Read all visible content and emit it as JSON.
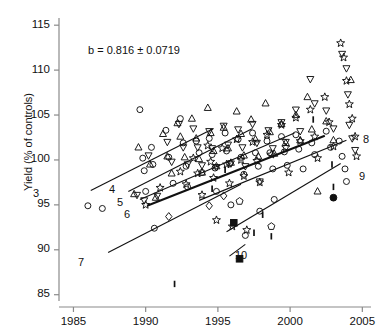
{
  "figure": {
    "width": 384,
    "height": 336,
    "background": "#ffffff",
    "ink": "#111111"
  },
  "annotation": {
    "equation": "b = 0.816 ± 0.0719",
    "equation_x": 88,
    "equation_y": 44
  },
  "axes": {
    "ylabel": "Yield (% of controls)",
    "xlabel": "",
    "x_ticks": [
      "1985",
      "1990",
      "1995",
      "2000",
      "2005"
    ],
    "y_ticks": [
      "85",
      "90",
      "95",
      "100",
      "105",
      "110",
      "115"
    ],
    "xlim": [
      1984.0,
      2005.6
    ],
    "ylim": [
      84.3,
      115.8
    ],
    "plot_rect": {
      "left": 59,
      "top": 18,
      "right": 371,
      "bottom": 301
    },
    "x_axis_baseline_y": 307,
    "spine_color": "#8a8a8a",
    "tick_len": 5
  },
  "chart_data": {
    "type": "scatter",
    "title": "",
    "xlabel": "",
    "ylabel": "Yield (% of controls)",
    "xlim": [
      1984.0,
      2005.6
    ],
    "ylim": [
      84.3,
      115.8
    ],
    "grid": false,
    "legend": "none",
    "annotations": [
      {
        "text": "b = 0.816 ± 0.0719",
        "x": 1990.0,
        "y": 112.0
      }
    ],
    "series": [
      {
        "name": "open-circle",
        "marker": "circle-open",
        "points": [
          [
            1986.0,
            94.9
          ],
          [
            1987.0,
            94.6
          ],
          [
            1989.6,
            105.6
          ],
          [
            1989.8,
            100.2
          ],
          [
            1989.9,
            98.8
          ],
          [
            1990.0,
            96.5
          ],
          [
            1990.4,
            101.4
          ],
          [
            1990.5,
            99.5
          ],
          [
            1990.6,
            92.4
          ],
          [
            1991.4,
            103.3
          ],
          [
            1991.6,
            100.3
          ],
          [
            1991.9,
            97.4
          ],
          [
            1992.4,
            104.6
          ],
          [
            1992.6,
            101.9
          ],
          [
            1992.8,
            99.3
          ],
          [
            1992.9,
            97.0
          ],
          [
            1993.5,
            102.1
          ],
          [
            1993.7,
            100.8
          ],
          [
            1993.9,
            98.6
          ],
          [
            1994.4,
            102.4
          ],
          [
            1994.6,
            100.6
          ],
          [
            1994.8,
            99.1
          ],
          [
            1994.9,
            96.5
          ],
          [
            1995.5,
            103.0
          ],
          [
            1995.6,
            101.0
          ],
          [
            1995.8,
            99.6
          ],
          [
            1995.9,
            95.0
          ],
          [
            1996.4,
            102.3
          ],
          [
            1996.6,
            100.3
          ],
          [
            1996.8,
            98.4
          ],
          [
            1996.9,
            91.6
          ],
          [
            1997.4,
            103.0
          ],
          [
            1997.6,
            100.8
          ],
          [
            1997.8,
            99.3
          ],
          [
            1997.9,
            94.3
          ],
          [
            1998.4,
            102.1
          ],
          [
            1998.6,
            100.8
          ],
          [
            1998.8,
            99.0
          ],
          [
            1998.9,
            95.6
          ],
          [
            1999.4,
            102.6
          ],
          [
            1999.6,
            100.9
          ],
          [
            1999.8,
            99.4
          ],
          [
            2000.4,
            102.8
          ],
          [
            2000.6,
            101.2
          ],
          [
            2000.9,
            99.0
          ],
          [
            2001.5,
            101.9
          ],
          [
            2001.7,
            100.6
          ],
          [
            2002.5,
            103.2
          ],
          [
            2002.8,
            101.4
          ],
          [
            2003.4,
            102.1
          ],
          [
            2003.6,
            100.4
          ],
          [
            2003.8,
            99.0
          ],
          [
            2003.9,
            97.6
          ]
        ]
      },
      {
        "name": "open-up-triangle",
        "marker": "triangle-up-open",
        "points": [
          [
            1989.2,
            96.2
          ],
          [
            1989.5,
            101.4
          ],
          [
            1990.3,
            99.5
          ],
          [
            1990.7,
            95.8
          ],
          [
            1991.2,
            102.9
          ],
          [
            1991.5,
            100.4
          ],
          [
            1991.8,
            98.5
          ],
          [
            1992.2,
            104.1
          ],
          [
            1992.4,
            102.6
          ],
          [
            1992.7,
            100.3
          ],
          [
            1993.2,
            104.6
          ],
          [
            1993.5,
            102.4
          ],
          [
            1993.7,
            100.1
          ],
          [
            1993.9,
            98.6
          ],
          [
            1994.3,
            105.8
          ],
          [
            1994.5,
            103.0
          ],
          [
            1994.7,
            101.0
          ],
          [
            1994.9,
            99.3
          ],
          [
            1995.4,
            103.6
          ],
          [
            1995.7,
            101.3
          ],
          [
            1995.9,
            99.7
          ],
          [
            1996.3,
            105.4
          ],
          [
            1996.6,
            102.9
          ],
          [
            1996.8,
            100.5
          ],
          [
            1997.3,
            104.5
          ],
          [
            1997.6,
            102.3
          ],
          [
            1997.8,
            100.4
          ],
          [
            1998.3,
            106.3
          ],
          [
            1998.6,
            103.1
          ],
          [
            1998.9,
            100.7
          ],
          [
            1999.4,
            104.0
          ],
          [
            1999.7,
            101.9
          ],
          [
            2000.4,
            105.0
          ],
          [
            2000.7,
            102.2
          ],
          [
            2001.2,
            107.0
          ],
          [
            2001.5,
            103.4
          ],
          [
            2001.9,
            96.5
          ],
          [
            2002.5,
            104.3
          ],
          [
            2003.0,
            102.2
          ],
          [
            2004.2,
            108.9
          ]
        ]
      },
      {
        "name": "open-down-triangle",
        "marker": "triangle-down-open",
        "points": [
          [
            1989.4,
            96.1
          ],
          [
            1989.9,
            95.5
          ],
          [
            1990.2,
            100.5
          ],
          [
            1990.8,
            96.0
          ],
          [
            1991.5,
            102.0
          ],
          [
            1991.8,
            99.8
          ],
          [
            1992.3,
            104.0
          ],
          [
            1992.6,
            101.4
          ],
          [
            1992.9,
            99.5
          ],
          [
            1993.3,
            103.5
          ],
          [
            1993.6,
            101.4
          ],
          [
            1993.9,
            99.4
          ],
          [
            1994.4,
            103.2
          ],
          [
            1994.6,
            101.3
          ],
          [
            1994.9,
            99.2
          ],
          [
            1995.4,
            103.8
          ],
          [
            1995.7,
            101.7
          ],
          [
            1995.9,
            99.6
          ],
          [
            1996.4,
            103.4
          ],
          [
            1996.7,
            101.4
          ],
          [
            1996.9,
            99.3
          ],
          [
            1997.4,
            104.0
          ],
          [
            1997.7,
            101.9
          ],
          [
            1997.9,
            97.6
          ],
          [
            1998.5,
            103.3
          ],
          [
            1998.8,
            101.3
          ],
          [
            1999.4,
            104.2
          ],
          [
            1999.7,
            102.0
          ],
          [
            2000.4,
            105.6
          ],
          [
            2000.7,
            103.2
          ],
          [
            2001.4,
            109.0
          ],
          [
            2001.7,
            106.3
          ],
          [
            2002.5,
            105.5
          ],
          [
            2003.0,
            103.5
          ],
          [
            2003.6,
            111.8
          ],
          [
            2003.9,
            110.2
          ],
          [
            2004.0,
            107.3
          ],
          [
            2004.1,
            103.9
          ],
          [
            2004.3,
            102.4
          ],
          [
            2004.5,
            101.1
          ]
        ]
      },
      {
        "name": "star",
        "marker": "star-open",
        "points": [
          [
            1990.0,
            95.0
          ],
          [
            1991.0,
            96.9
          ],
          [
            1992.4,
            98.7
          ],
          [
            1992.8,
            97.3
          ],
          [
            1993.3,
            100.2
          ],
          [
            1993.6,
            98.5
          ],
          [
            1993.9,
            96.1
          ],
          [
            1994.3,
            101.6
          ],
          [
            1994.5,
            99.8
          ],
          [
            1994.7,
            98.0
          ],
          [
            1994.9,
            93.3
          ],
          [
            1995.3,
            101.3
          ],
          [
            1995.6,
            99.5
          ],
          [
            1995.8,
            97.4
          ],
          [
            1996.0,
            92.6
          ],
          [
            1996.3,
            102.3
          ],
          [
            1996.6,
            100.0
          ],
          [
            1996.8,
            98.2
          ],
          [
            1997.0,
            92.2
          ],
          [
            1997.4,
            102.0
          ],
          [
            1997.7,
            99.9
          ],
          [
            1997.9,
            97.5
          ],
          [
            1998.4,
            102.8
          ],
          [
            1998.7,
            100.6
          ],
          [
            1999.4,
            103.9
          ],
          [
            1999.7,
            101.4
          ],
          [
            1999.9,
            98.6
          ],
          [
            2000.4,
            104.7
          ],
          [
            2000.7,
            102.1
          ],
          [
            2001.4,
            105.6
          ],
          [
            2001.7,
            102.6
          ],
          [
            2001.9,
            100.2
          ],
          [
            2002.4,
            107.0
          ],
          [
            2002.7,
            104.2
          ],
          [
            2003.0,
            101.5
          ],
          [
            2003.5,
            113.0
          ],
          [
            2003.7,
            111.4
          ],
          [
            2003.9,
            108.8
          ],
          [
            2004.1,
            106.2
          ],
          [
            2004.3,
            104.6
          ],
          [
            2004.5,
            102.6
          ],
          [
            2004.6,
            100.4
          ]
        ]
      },
      {
        "name": "open-diamond",
        "marker": "diamond-open",
        "points": [
          [
            1991.6,
            93.7
          ],
          [
            1994.4,
            94.9
          ],
          [
            1995.4,
            96.0
          ]
        ]
      },
      {
        "name": "open-pentagon",
        "marker": "pentagon-open",
        "points": [
          [
            1996.5,
            95.4
          ],
          [
            1998.7,
            92.6
          ]
        ]
      },
      {
        "name": "filled-square",
        "marker": "square-filled",
        "points": [
          [
            1996.1,
            93.0
          ],
          [
            1996.5,
            89.0
          ]
        ]
      },
      {
        "name": "filled-circle",
        "marker": "circle-filled",
        "points": [
          [
            2003.0,
            95.8
          ]
        ]
      },
      {
        "name": "error-tick",
        "marker": "vertical-tick",
        "points": [
          [
            1992.0,
            86.2
          ],
          [
            1994.6,
            96.8
          ],
          [
            1995.5,
            98.9
          ],
          [
            1997.5,
            91.9
          ],
          [
            1998.7,
            91.5
          ],
          [
            1998.1,
            93.9
          ],
          [
            2001.6,
            104.5
          ],
          [
            2002.9,
            99.5
          ],
          [
            2003.0,
            97.0
          ]
        ]
      }
    ],
    "trend_lines": [
      {
        "label": "3",
        "x0": 1986.2,
        "y0": 96.6,
        "x1": 1994.7,
        "y1": 103.5
      },
      {
        "label": "4",
        "x0": 1988.8,
        "y0": 96.5,
        "x1": 1997.4,
        "y1": 103.5
      },
      {
        "label": "5",
        "x0": 1989.6,
        "y0": 95.6,
        "x1": 2000.3,
        "y1": 103.0
      },
      {
        "label": "6",
        "x0": 1990.1,
        "y0": 94.9,
        "x1": 2002.4,
        "y1": 102.7
      },
      {
        "label": "7",
        "x0": 1987.4,
        "y0": 89.7,
        "x1": 1996.6,
        "y1": 97.3
      },
      {
        "label": "8",
        "x0": 1993.7,
        "y0": 95.5,
        "x1": 2003.9,
        "y1": 102.2
      },
      {
        "label": "9",
        "x0": 1995.6,
        "y0": 92.0,
        "x1": 2003.5,
        "y1": 99.6
      },
      {
        "label": "10",
        "x0": 1995.8,
        "y0": 89.3,
        "x1": 1996.9,
        "y1": 90.6
      }
    ],
    "line_labels": [
      {
        "text": "3",
        "x": 33,
        "y": 187
      },
      {
        "text": "4",
        "x": 109,
        "y": 183
      },
      {
        "text": "5",
        "x": 117,
        "y": 196
      },
      {
        "text": "6",
        "x": 124,
        "y": 208
      },
      {
        "text": "7",
        "x": 78,
        "y": 256
      },
      {
        "text": "8",
        "x": 363,
        "y": 133
      },
      {
        "text": "9",
        "x": 359,
        "y": 170
      },
      {
        "text": "10",
        "x": 235,
        "y": 249
      }
    ]
  }
}
